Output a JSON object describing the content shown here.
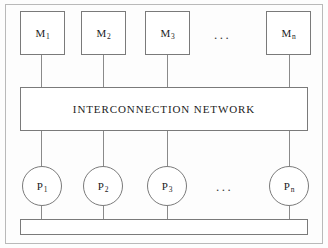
{
  "figure": {
    "background_color": "#fdfdfd",
    "line_color": "#7a7a7a",
    "text_color": "#1c1c1c"
  },
  "memory_units": {
    "row_label": "memory modules",
    "items": [
      {
        "base": "M",
        "sub": "1",
        "x": 20,
        "y": 11,
        "w": 45,
        "h": 44
      },
      {
        "base": "M",
        "sub": "2",
        "x": 81,
        "y": 11,
        "w": 45,
        "h": 44
      },
      {
        "base": "M",
        "sub": "3",
        "x": 145,
        "y": 11,
        "w": 45,
        "h": 44
      },
      {
        "base": "M",
        "sub": "n",
        "x": 266,
        "y": 11,
        "w": 45,
        "h": 44
      }
    ],
    "ellipsis": {
      "text": "...",
      "x": 214,
      "y": 28
    }
  },
  "network": {
    "label": "INTERCONNECTION NETWORK",
    "x": 20,
    "y": 87,
    "w": 288,
    "h": 44
  },
  "processors": {
    "row_label": "processors",
    "items": [
      {
        "base": "P",
        "sub": "1",
        "cx": 42,
        "cy": 186,
        "r": 20
      },
      {
        "base": "P",
        "sub": "2",
        "cx": 103,
        "cy": 186,
        "r": 20
      },
      {
        "base": "P",
        "sub": "3",
        "cx": 167,
        "cy": 186,
        "r": 20
      },
      {
        "base": "P",
        "sub": "n",
        "cx": 289,
        "cy": 186,
        "r": 20
      }
    ],
    "ellipsis": {
      "text": "...",
      "x": 216,
      "y": 180
    }
  },
  "bus": {
    "label": "system bus",
    "x": 20,
    "y": 219,
    "w": 288,
    "h": 16
  },
  "links": {
    "memory_to_network": [
      {
        "x": 41,
        "y": 55,
        "h": 32
      },
      {
        "x": 103,
        "y": 55,
        "h": 32
      },
      {
        "x": 167,
        "y": 55,
        "h": 32
      },
      {
        "x": 289,
        "y": 55,
        "h": 32
      }
    ],
    "network_to_processor": [
      {
        "x": 41,
        "y": 131,
        "h": 35
      },
      {
        "x": 103,
        "y": 131,
        "h": 35
      },
      {
        "x": 167,
        "y": 131,
        "h": 35
      },
      {
        "x": 289,
        "y": 131,
        "h": 35
      }
    ],
    "processor_to_bus": [
      {
        "x": 41,
        "y": 206,
        "h": 13
      },
      {
        "x": 103,
        "y": 206,
        "h": 13
      },
      {
        "x": 167,
        "y": 206,
        "h": 13
      },
      {
        "x": 289,
        "y": 206,
        "h": 13
      }
    ]
  }
}
